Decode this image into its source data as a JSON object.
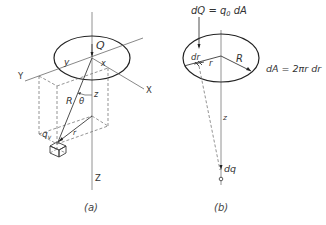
{
  "figure_a": {
    "caption": "(a)",
    "labels": {
      "Q": "Q",
      "y": "y",
      "x": "x",
      "Y": "Y",
      "X": "X",
      "R": "R",
      "theta": "θ",
      "z": "z",
      "r": "r",
      "qv": "q",
      "qv_sub": "v",
      "Z": "Z"
    }
  },
  "figure_b": {
    "caption": "(b)",
    "labels": {
      "dQ_eq": "dQ = q",
      "dQ_sub": "0",
      "dQ_rest": " dA",
      "dr": "dr",
      "r": "r",
      "R": "R",
      "dA_eq": "dA = 2πr dr",
      "z": "z",
      "dq": "dq"
    }
  }
}
